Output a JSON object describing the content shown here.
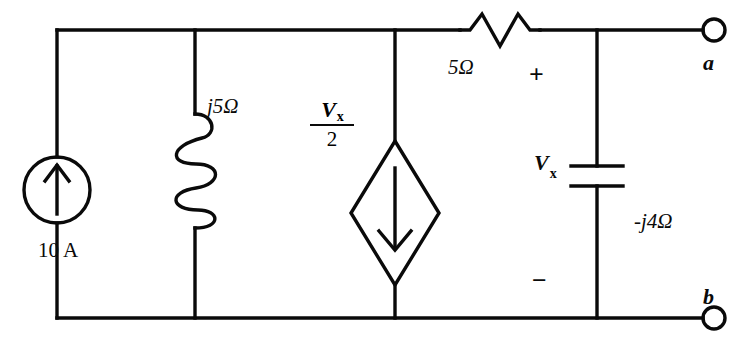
{
  "diagram": {
    "stroke_color": "#0a0a0a",
    "background_color": "#ffffff"
  },
  "components": {
    "current_source": {
      "name": "independent-current-source",
      "label": "10 A",
      "value": "10",
      "unit": "A",
      "arrow_direction": "up",
      "symbol": "circle"
    },
    "inductor": {
      "name": "inductor",
      "label": "j5Ω",
      "value": "j5",
      "unit": "Ω",
      "symbol": "coil"
    },
    "dependent_source": {
      "name": "dependent-current-source",
      "numerator": "V",
      "numerator_subscript": "x",
      "denominator": "2",
      "label": "Vx/2",
      "arrow_direction": "down",
      "symbol": "diamond"
    },
    "resistor": {
      "name": "resistor",
      "label": "5Ω",
      "value": "5",
      "unit": "Ω",
      "symbol": "zigzag"
    },
    "capacitor": {
      "name": "capacitor",
      "label": "-j4Ω",
      "value": "-j4",
      "unit": "Ω",
      "symbol": "parallel-plates",
      "voltage_label": "V",
      "voltage_subscript": "x",
      "polarity_plus": "+",
      "polarity_minus": "−"
    }
  },
  "terminals": {
    "a": {
      "label": "a",
      "position": "top-right"
    },
    "b": {
      "label": "b",
      "position": "bottom-right"
    }
  }
}
